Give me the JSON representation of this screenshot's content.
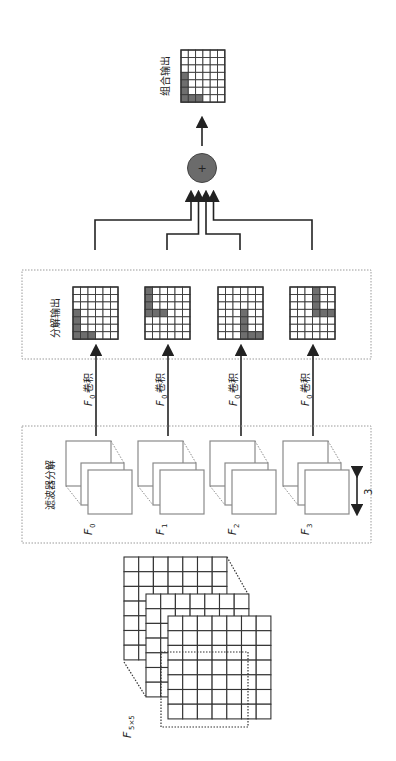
{
  "diagram": {
    "orientation": "rotated-90-ccw",
    "combined_output": {
      "label": "组合输出",
      "grid": {
        "cols": 6,
        "rows": 7,
        "shaded": [
          [
            0,
            3
          ],
          [
            0,
            4
          ],
          [
            0,
            5
          ],
          [
            0,
            6
          ],
          [
            1,
            6
          ],
          [
            2,
            6
          ]
        ]
      }
    },
    "sum_node": {
      "symbol": "+",
      "color": "#6b6b6b"
    },
    "decomposition_output": {
      "label": "分解输出",
      "grids": [
        {
          "cols": 6,
          "rows": 7,
          "shaded": [
            [
              0,
              3
            ],
            [
              0,
              4
            ],
            [
              0,
              5
            ],
            [
              0,
              6
            ],
            [
              1,
              6
            ],
            [
              2,
              6
            ]
          ]
        },
        {
          "cols": 6,
          "rows": 7,
          "shaded": [
            [
              0,
              0
            ],
            [
              0,
              1
            ],
            [
              0,
              2
            ],
            [
              0,
              3
            ],
            [
              1,
              3
            ],
            [
              2,
              3
            ]
          ]
        },
        {
          "cols": 6,
          "rows": 7,
          "shaded": [
            [
              3,
              3
            ],
            [
              3,
              4
            ],
            [
              3,
              5
            ],
            [
              3,
              6
            ],
            [
              4,
              6
            ],
            [
              5,
              6
            ]
          ]
        },
        {
          "cols": 6,
          "rows": 7,
          "shaded": [
            [
              3,
              0
            ],
            [
              3,
              1
            ],
            [
              3,
              2
            ],
            [
              3,
              3
            ],
            [
              4,
              3
            ],
            [
              5,
              3
            ]
          ]
        }
      ]
    },
    "convolution_labels": [
      {
        "symbol": "F",
        "sub": "0",
        "text": "卷积"
      },
      {
        "symbol": "F",
        "sub": "0",
        "text": "卷积"
      },
      {
        "symbol": "F",
        "sub": "0",
        "text": "卷积"
      },
      {
        "symbol": "F",
        "sub": "0",
        "text": "卷积"
      }
    ],
    "filter_decomposition": {
      "label": "滤波器分解",
      "filters": [
        {
          "symbol": "F",
          "sub": "0"
        },
        {
          "symbol": "F",
          "sub": "1"
        },
        {
          "symbol": "F",
          "sub": "2"
        },
        {
          "symbol": "F",
          "sub": "3"
        }
      ],
      "dimension_label": "3"
    },
    "input": {
      "symbol": "F",
      "sub": "5×5",
      "layers": 3,
      "grid": {
        "cols": 7,
        "rows": 7
      }
    },
    "colors": {
      "shade": "#6e6e6e",
      "line": "#222222",
      "dotted": "#9a9a9a"
    }
  }
}
